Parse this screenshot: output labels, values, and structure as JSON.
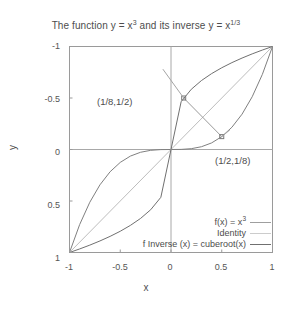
{
  "chart_data": {
    "type": "line",
    "title_main": "The function y = x",
    "title_exp1": "3",
    "title_mid": " and its inverse y = x",
    "title_exp2": "1/3",
    "xlabel": "x",
    "ylabel": "y",
    "xlim": [
      -1,
      1
    ],
    "ylim": [
      -1,
      1
    ],
    "grid": false,
    "legend_position": "bottom-right",
    "xticks": [
      "-1",
      "-0.5",
      "0",
      "0.5",
      "1"
    ],
    "xtick_values": [
      -1,
      -0.5,
      0,
      0.5,
      1
    ],
    "yticks": [
      "-1",
      "-0.5",
      "0",
      "0.5",
      "1"
    ],
    "ytick_values": [
      -1,
      -0.5,
      0,
      0.5,
      1
    ],
    "series": [
      {
        "name": "f(x) = x^3",
        "legend_text": "f(x) = x",
        "legend_exp": "3",
        "color": "#808080",
        "x": [
          -1,
          -0.9,
          -0.8,
          -0.7,
          -0.6,
          -0.5,
          -0.4,
          -0.3,
          -0.2,
          -0.1,
          0,
          0.1,
          0.2,
          0.3,
          0.4,
          0.5,
          0.6,
          0.7,
          0.8,
          0.9,
          1
        ],
        "values": [
          -1,
          -0.729,
          -0.512,
          -0.343,
          -0.216,
          -0.125,
          -0.064,
          -0.027,
          -0.008,
          -0.001,
          0,
          0.001,
          0.008,
          0.027,
          0.064,
          0.125,
          0.216,
          0.343,
          0.512,
          0.729,
          1
        ]
      },
      {
        "name": "Identity",
        "legend_text": "Identity",
        "legend_exp": "",
        "color": "#bdbdbd",
        "x": [
          -1,
          1
        ],
        "values": [
          -1,
          1
        ]
      },
      {
        "name": "f Inverse (x) = cuberoot(x)",
        "legend_text": "f Inverse (x) = cuberoot(x)",
        "legend_exp": "",
        "color": "#707070",
        "x": [
          -1,
          -0.9,
          -0.8,
          -0.7,
          -0.6,
          -0.5,
          -0.4,
          -0.3,
          -0.2,
          -0.1,
          0,
          0.1,
          0.2,
          0.3,
          0.4,
          0.5,
          0.6,
          0.7,
          0.8,
          0.9,
          1
        ],
        "values": [
          -1,
          -0.9655,
          -0.9283,
          -0.8879,
          -0.8434,
          -0.7937,
          -0.7368,
          -0.6694,
          -0.5848,
          -0.4642,
          0,
          0.4642,
          0.5848,
          0.6694,
          0.7368,
          0.7937,
          0.8434,
          0.8879,
          0.9283,
          0.9655,
          1
        ]
      }
    ],
    "annotations": [
      {
        "text": "(1/8,1/2)",
        "point_x": 0.125,
        "point_y": 0.5,
        "label_x": -0.08,
        "label_y": 0.78
      },
      {
        "text": "(1/2,1/8)",
        "point_x": 0.5,
        "point_y": 0.125,
        "label_x": 0.58,
        "label_y": 0.19
      }
    ],
    "connector": {
      "from_x": 0.125,
      "from_y": 0.5,
      "to_x": 0.5,
      "to_y": 0.125
    }
  }
}
